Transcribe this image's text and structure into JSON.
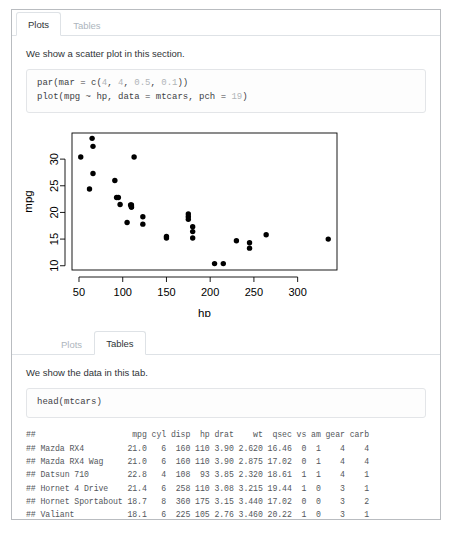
{
  "sections": [
    {
      "name": "plots-section",
      "tabs": [
        {
          "label": "Plots",
          "active": true
        },
        {
          "label": "Tables",
          "active": false
        }
      ],
      "prose": "We show a scatter plot in this section.",
      "code_lines": [
        [
          {
            "t": "par(mar = c("
          },
          {
            "t": "4",
            "n": true
          },
          {
            "t": ", "
          },
          {
            "t": "4",
            "n": true
          },
          {
            "t": ", "
          },
          {
            "t": "0.5",
            "n": true
          },
          {
            "t": ", "
          },
          {
            "t": "0.1",
            "n": true
          },
          {
            "t": "))"
          }
        ],
        [
          {
            "t": "plot(mpg ~ hp, data = mtcars, pch = "
          },
          {
            "t": "19",
            "n": true
          },
          {
            "t": ")"
          }
        ]
      ]
    },
    {
      "name": "tables-section",
      "tabs": [
        {
          "label": "Plots",
          "active": false
        },
        {
          "label": "Tables",
          "active": true
        }
      ],
      "prose": "We show the data in this tab.",
      "code_lines": [
        [
          {
            "t": "head(mtcars)"
          }
        ]
      ],
      "output_lines": [
        "##                    mpg cyl disp  hp drat    wt  qsec vs am gear carb",
        "## Mazda RX4         21.0   6  160 110 3.90 2.620 16.46  0  1    4    4",
        "## Mazda RX4 Wag     21.0   6  160 110 3.90 2.875 17.02  0  1    4    4",
        "## Datsun 710        22.8   4  108  93 3.85 2.320 18.61  1  1    4    1",
        "## Hornet 4 Drive    21.4   6  258 110 3.08 3.215 19.44  1  0    3    1",
        "## Hornet Sportabout 18.7   8  360 175 3.15 3.440 17.02  0  0    3    2",
        "## Valiant           18.1   6  225 105 2.76 3.460 20.22  1  0    3    1"
      ]
    }
  ],
  "chart_data": {
    "type": "scatter",
    "title": "",
    "xlabel": "hp",
    "ylabel": "mpg",
    "xlim": [
      42,
      345
    ],
    "ylim": [
      9.2,
      34.9
    ],
    "xticks": [
      50,
      100,
      150,
      200,
      250,
      300
    ],
    "yticks": [
      10,
      15,
      20,
      25,
      30
    ],
    "grid": false,
    "legend": false,
    "marker": "filled-circle",
    "marker_color": "#000000",
    "points": [
      {
        "label": "Mazda RX4",
        "x": 110,
        "y": 21.0
      },
      {
        "label": "Mazda RX4 Wag",
        "x": 110,
        "y": 21.0
      },
      {
        "label": "Datsun 710",
        "x": 93,
        "y": 22.8
      },
      {
        "label": "Hornet 4 Drive",
        "x": 110,
        "y": 21.4
      },
      {
        "label": "Hornet Sportabout",
        "x": 175,
        "y": 18.7
      },
      {
        "label": "Valiant",
        "x": 105,
        "y": 18.1
      },
      {
        "label": "Duster 360",
        "x": 245,
        "y": 14.3
      },
      {
        "label": "Merc 240D",
        "x": 62,
        "y": 24.4
      },
      {
        "label": "Merc 230",
        "x": 95,
        "y": 22.8
      },
      {
        "label": "Merc 280",
        "x": 123,
        "y": 19.2
      },
      {
        "label": "Merc 280C",
        "x": 123,
        "y": 17.8
      },
      {
        "label": "Merc 450SE",
        "x": 180,
        "y": 16.4
      },
      {
        "label": "Merc 450SL",
        "x": 180,
        "y": 17.3
      },
      {
        "label": "Merc 450SLC",
        "x": 180,
        "y": 15.2
      },
      {
        "label": "Cadillac Fleetwood",
        "x": 205,
        "y": 10.4
      },
      {
        "label": "Lincoln Continental",
        "x": 215,
        "y": 10.4
      },
      {
        "label": "Chrysler Imperial",
        "x": 230,
        "y": 14.7
      },
      {
        "label": "Fiat 128",
        "x": 66,
        "y": 32.4
      },
      {
        "label": "Honda Civic",
        "x": 52,
        "y": 30.4
      },
      {
        "label": "Toyota Corolla",
        "x": 65,
        "y": 33.9
      },
      {
        "label": "Toyota Corona",
        "x": 97,
        "y": 21.5
      },
      {
        "label": "Dodge Challenger",
        "x": 150,
        "y": 15.5
      },
      {
        "label": "AMC Javelin",
        "x": 150,
        "y": 15.2
      },
      {
        "label": "Camaro Z28",
        "x": 245,
        "y": 13.3
      },
      {
        "label": "Pontiac Firebird",
        "x": 175,
        "y": 19.2
      },
      {
        "label": "Fiat X1-9",
        "x": 66,
        "y": 27.3
      },
      {
        "label": "Porsche 914-2",
        "x": 91,
        "y": 26.0
      },
      {
        "label": "Lotus Europa",
        "x": 113,
        "y": 30.4
      },
      {
        "label": "Ford Pantera L",
        "x": 264,
        "y": 15.8
      },
      {
        "label": "Ferrari Dino",
        "x": 175,
        "y": 19.7
      },
      {
        "label": "Maserati Bora",
        "x": 335,
        "y": 15.0
      },
      {
        "label": "Volvo 142E",
        "x": 109,
        "y": 21.4
      }
    ]
  }
}
